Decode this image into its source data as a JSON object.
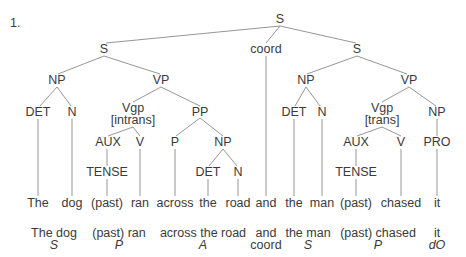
{
  "example_number": "1.",
  "tree": {
    "root": "S",
    "conjunct_left": "S",
    "coordinator": "coord",
    "conjunct_right": "S",
    "left": {
      "np": "NP",
      "vp": "VP",
      "det": "DET",
      "n": "N",
      "vgp": "Vgp",
      "vgp_feature": "[intrans]",
      "pp": "PP",
      "aux": "AUX",
      "v": "V",
      "p": "P",
      "pp_np": "NP",
      "tense": "TENSE",
      "pp_det": "DET",
      "pp_n": "N"
    },
    "right": {
      "np": "NP",
      "vp": "VP",
      "det": "DET",
      "n": "N",
      "vgp": "Vgp",
      "vgp_feature": "[trans]",
      "obj_np": "NP",
      "aux": "AUX",
      "v": "V",
      "pro": "PRO",
      "tense": "TENSE"
    }
  },
  "words": [
    "The",
    "dog",
    "(past)",
    "ran",
    "across",
    "the",
    "road",
    "and",
    "the",
    "man",
    "(past)",
    "chased",
    "it"
  ],
  "functions": [
    {
      "phrase": "The dog",
      "role": "S"
    },
    {
      "phrase": "(past) ran",
      "role": "P"
    },
    {
      "phrase": "across the road",
      "role": "A"
    },
    {
      "phrase": "and",
      "role": "coord"
    },
    {
      "phrase": "the man",
      "role": "S"
    },
    {
      "phrase": "(past) chased",
      "role": "P"
    },
    {
      "phrase": "it",
      "role": "dO"
    }
  ]
}
